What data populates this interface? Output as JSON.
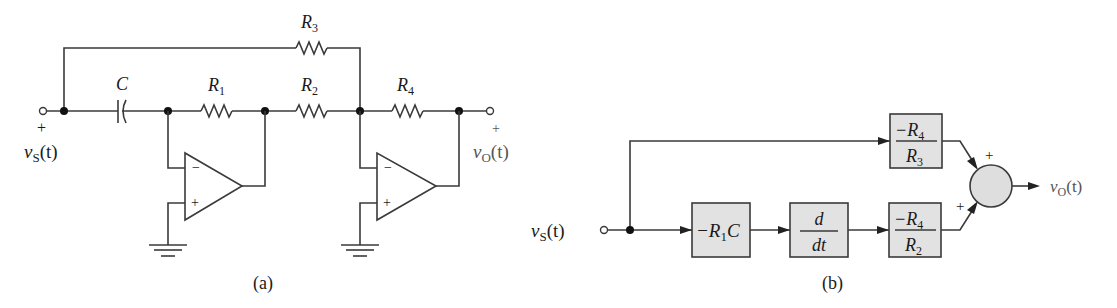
{
  "figure_a": {
    "caption": "(a)",
    "components": {
      "capacitor": {
        "label": "C"
      },
      "r1": {
        "label": "R",
        "sub": "1"
      },
      "r2": {
        "label": "R",
        "sub": "2"
      },
      "r3": {
        "label": "R",
        "sub": "3"
      },
      "r4": {
        "label": "R",
        "sub": "4"
      }
    },
    "input": {
      "plus": "+",
      "var": "v",
      "sub": "S",
      "arg": "(t)"
    },
    "output": {
      "plus": "+",
      "var": "v",
      "sub": "O",
      "arg": "(t)"
    },
    "opamp1": {
      "minus": "−",
      "plus": "+"
    },
    "opamp2": {
      "minus": "−",
      "plus": "+"
    }
  },
  "figure_b": {
    "caption": "(b)",
    "input": {
      "var": "v",
      "sub": "S",
      "arg": "(t)"
    },
    "output": {
      "var": "v",
      "sub": "O",
      "arg": "(t)"
    },
    "blocks": {
      "r1c": {
        "text": "−R",
        "sub": "1",
        "tail": "C"
      },
      "ddt": {
        "num": "d",
        "den": "dt"
      },
      "gain_r3": {
        "num": "−R",
        "num_sub": "4",
        "den": "R",
        "den_sub": "3"
      },
      "gain_r2": {
        "num": "−R",
        "num_sub": "4",
        "den": "R",
        "den_sub": "2"
      }
    },
    "summer": {
      "sign_top": "+",
      "sign_bottom": "+"
    }
  }
}
